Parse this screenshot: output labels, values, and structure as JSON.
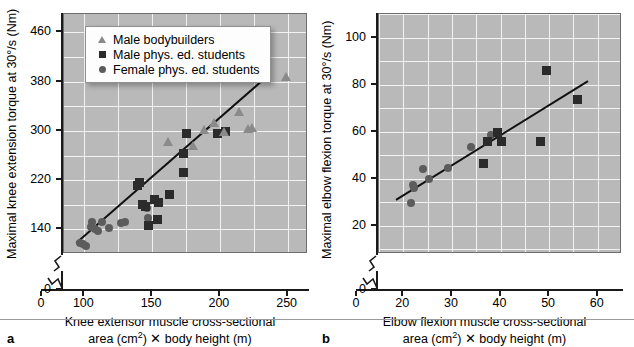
{
  "figure": {
    "background": "#ffffff",
    "plot_background": "#b9b9b9",
    "gridline_color": "#f2f2f2",
    "axis_color": "#1a1a1a"
  },
  "legend": {
    "position": "upper-left-inside-panel-a",
    "items": [
      {
        "symbol": "triangle",
        "label": "Male bodybuilders",
        "color": "#8a8a8a"
      },
      {
        "symbol": "square",
        "label": "Male phys. ed. students",
        "color": "#2b2b2b"
      },
      {
        "symbol": "circle",
        "label": "Female phys. ed. students",
        "color": "#5c5c5c"
      }
    ]
  },
  "panels": [
    {
      "letter": "a",
      "ylabel_line1": "Maximal knee extension torque at 30",
      "ylabel_deg": "°",
      "ylabel_line2": "/s (Nm)",
      "xlabel_line1": "Knee extensor muscle cross-sectional",
      "xlabel_line2_pre": "area (cm",
      "xlabel_sup": "2",
      "xlabel_line2_post": ") ✕ body height (m)",
      "y_ticks": [
        "0",
        "140",
        "220",
        "300",
        "380",
        "460"
      ],
      "x_ticks": [
        "0",
        "100",
        "150",
        "200",
        "250"
      ],
      "axis_break_y": true,
      "axis_break_x": true
    },
    {
      "letter": "b",
      "ylabel_line1": "Maximal elbow flexion torque at 30",
      "ylabel_deg": "°",
      "ylabel_line2": "/s (Nm)",
      "xlabel_line1": "Elbow flexion muscle cross-sectional",
      "xlabel_line2_pre": "area (cm",
      "xlabel_sup": "2",
      "xlabel_line2_post": ") ✕ body height (m)",
      "y_ticks": [
        "0",
        "20",
        "40",
        "60",
        "80",
        "100"
      ],
      "x_ticks": [
        "0",
        "20",
        "30",
        "40",
        "50",
        "60"
      ],
      "axis_break_y": true,
      "axis_break_x": true
    }
  ],
  "chart_data": [
    {
      "type": "scatter",
      "panel": "a",
      "title": "",
      "xlabel": "Knee extensor muscle cross-sectional area (cm^2) x body height (m)",
      "ylabel": "Maximal knee extension torque at 30°/s (Nm)",
      "xlim": [
        85,
        265
      ],
      "ylim": [
        100,
        490
      ],
      "xticks": [
        100,
        150,
        200,
        250
      ],
      "yticks": [
        140,
        220,
        300,
        380,
        460
      ],
      "grid": true,
      "legend_position": "upper left",
      "series": [
        {
          "name": "Female phys. ed. students",
          "marker": "circle",
          "color": "#5c5c5c",
          "points": [
            [
              97,
              118
            ],
            [
              99,
              116
            ],
            [
              101,
              113
            ],
            [
              105,
              144
            ],
            [
              106,
              152
            ],
            [
              108,
              141
            ],
            [
              110,
              138
            ],
            [
              113,
              152
            ],
            [
              118,
              143
            ],
            [
              127,
              150
            ],
            [
              130,
              152
            ],
            [
              146,
              174
            ],
            [
              147,
              158
            ]
          ]
        },
        {
          "name": "Male phys. ed. students",
          "marker": "square",
          "color": "#2b2b2b",
          "points": [
            [
              139,
              211
            ],
            [
              141,
              217
            ],
            [
              143,
              181
            ],
            [
              145,
              178
            ],
            [
              147,
              146
            ],
            [
              152,
              189
            ],
            [
              154,
              156
            ],
            [
              155,
              183
            ],
            [
              163,
              196
            ],
            [
              173,
              232
            ],
            [
              175,
              296
            ],
            [
              173,
              264
            ],
            [
              198,
              296
            ],
            [
              204,
              299
            ]
          ]
        },
        {
          "name": "Male bodybuilders",
          "marker": "triangle",
          "color": "#8a8a8a",
          "points": [
            [
              162,
              282
            ],
            [
              180,
              275
            ],
            [
              188,
              302
            ],
            [
              196,
              313
            ],
            [
              203,
              299
            ],
            [
              214,
              330
            ],
            [
              221,
              303
            ],
            [
              224,
              305
            ],
            [
              249,
              388
            ]
          ]
        }
      ],
      "fit_line": {
        "x": [
          94,
          232
        ],
        "y": [
          118,
          383
        ]
      }
    },
    {
      "type": "scatter",
      "panel": "b",
      "title": "",
      "xlabel": "Elbow flexion muscle cross-sectional area (cm^2) x body height (m)",
      "ylabel": "Maximal elbow flexion torque at 30°/s (Nm)",
      "xlim": [
        15,
        65
      ],
      "ylim": [
        8,
        110
      ],
      "xticks": [
        20,
        30,
        40,
        50,
        60
      ],
      "yticks": [
        20,
        40,
        60,
        80,
        100
      ],
      "grid": true,
      "legend_position": "none",
      "series": [
        {
          "name": "Female phys. ed. students",
          "marker": "circle",
          "color": "#5c5c5c",
          "points": [
            [
              21.5,
              29.5
            ],
            [
              22.0,
              37.5
            ],
            [
              22.3,
              36.2
            ],
            [
              24.0,
              44.0
            ],
            [
              25.2,
              40.0
            ],
            [
              29.3,
              44.5
            ],
            [
              34.0,
              53.5
            ],
            [
              38.0,
              58.5
            ]
          ]
        },
        {
          "name": "Male phys. ed. students",
          "marker": "square",
          "color": "#2b2b2b",
          "points": [
            [
              36.5,
              46.5
            ],
            [
              37.3,
              56.0
            ],
            [
              39.3,
              59.5
            ],
            [
              40.2,
              56.0
            ],
            [
              48.2,
              56.0
            ],
            [
              49.5,
              86.0
            ],
            [
              55.8,
              73.5
            ]
          ]
        }
      ],
      "fit_line": {
        "x": [
          18.5,
          58.0
        ],
        "y": [
          31.0,
          81.5
        ]
      }
    }
  ]
}
